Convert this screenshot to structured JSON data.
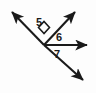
{
  "figure": {
    "type": "geometry-angle-diagram",
    "background_color": "#fdfdfd",
    "stroke_color": "#1a1a1a",
    "label_color": "#1a1a1a",
    "canvas": {
      "width": 96,
      "height": 93
    }
  },
  "vertex": {
    "name": "common-vertex",
    "x": 44,
    "y": 45
  },
  "rays": [
    {
      "id": "ray-upper-left",
      "label": "upper-left ray",
      "from": {
        "x": 44,
        "y": 45
      },
      "to": {
        "x": 9,
        "y": 9
      },
      "arrowhead": true
    },
    {
      "id": "ray-upper-right",
      "label": "upper-right ray",
      "from": {
        "x": 44,
        "y": 45
      },
      "to": {
        "x": 78,
        "y": 9
      },
      "arrowhead": true
    },
    {
      "id": "ray-horizontal-right",
      "label": "horizontal right ray",
      "from": {
        "x": 44,
        "y": 45
      },
      "to": {
        "x": 90,
        "y": 45
      },
      "arrowhead": true
    },
    {
      "id": "ray-lower-right",
      "label": "lower-right ray",
      "from": {
        "x": 44,
        "y": 45
      },
      "to": {
        "x": 86,
        "y": 83
      },
      "arrowhead": true
    }
  ],
  "right_angle_marker": {
    "name": "right-angle-square",
    "between": [
      "ray-upper-left",
      "ray-upper-right"
    ],
    "points": "44,33 38,27 44,21 50,27"
  },
  "labels": [
    {
      "id": "label-5",
      "text": "5",
      "x": 39,
      "y": 26,
      "angle_between": [
        "ray-upper-left",
        "ray-upper-right"
      ]
    },
    {
      "id": "label-6",
      "text": "6",
      "x": 59,
      "y": 41,
      "angle_between": [
        "ray-upper-right",
        "ray-horizontal-right"
      ]
    },
    {
      "id": "label-7",
      "text": "7",
      "x": 57,
      "y": 58,
      "angle_between": [
        "ray-horizontal-right",
        "ray-lower-right"
      ]
    }
  ]
}
